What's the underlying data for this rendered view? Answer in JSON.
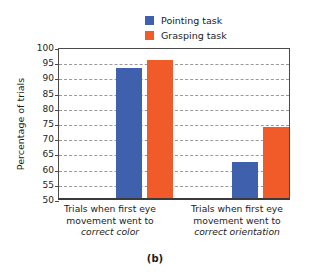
{
  "chart_data": {
    "type": "bar",
    "title": "",
    "subtitle": "",
    "xlabel": "",
    "ylabel": "Percentage of trials",
    "ylim": [
      50,
      100
    ],
    "ytick_step": 5,
    "yticks": [
      100,
      95,
      90,
      85,
      80,
      75,
      70,
      65,
      60,
      55,
      50
    ],
    "grid": true,
    "grid_style": "dashed-horizontal",
    "legend_position": "top-center",
    "categories": [
      "Trials when first eye movement went to correct color",
      "Trials when first eye movement went to correct orientation"
    ],
    "category_lines": [
      [
        "Trials when first eye",
        "movement went to",
        "correct color"
      ],
      [
        "Trials when first eye",
        "movement went to",
        "correct orientation"
      ]
    ],
    "series": [
      {
        "name": "Pointing task",
        "color": "#3F60AC",
        "values": [
          92.8,
          62.0
        ]
      },
      {
        "name": "Grasping task",
        "color": "#F15A29",
        "values": [
          95.3,
          73.2
        ]
      }
    ],
    "annotations": [],
    "panel_caption": "(b)"
  },
  "legend": {
    "items": [
      {
        "label": "Pointing task",
        "color": "#3F60AC"
      },
      {
        "label": "Grasping task",
        "color": "#F15A29"
      }
    ]
  },
  "axes": {
    "y_title": "Percentage of trials",
    "y_tick_labels": [
      "100",
      "95",
      "90",
      "85",
      "80",
      "75",
      "70",
      "65",
      "60",
      "55",
      "50"
    ]
  },
  "caption": {
    "text": "(b)"
  },
  "colors": {
    "pointing": "#3F60AC",
    "grasping": "#F15A29",
    "axis": "#4a4a4a",
    "grid": "#9a9a9a",
    "background": "#ffffff",
    "text": "#1c1c1c"
  }
}
